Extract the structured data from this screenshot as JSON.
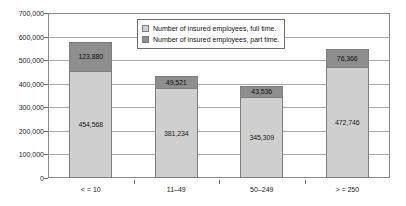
{
  "chart_data": {
    "type": "bar",
    "subtype": "stacked-bar",
    "title": "",
    "xlabel": "",
    "ylabel": "",
    "categories": [
      "< = 10",
      "11–49",
      "50–249",
      "> = 250"
    ],
    "series": [
      {
        "name": "Number of insured employees, full time.",
        "color": "#cfcfcf",
        "values": [
          454568,
          381234,
          345309,
          472746
        ],
        "labels": [
          "454,568",
          "381,234",
          "345,309",
          "472,746"
        ]
      },
      {
        "name": "Number of insured employees, part time.",
        "color": "#8e8e8e",
        "values": [
          123880,
          49521,
          43536,
          76366
        ],
        "labels": [
          "123,880",
          "49,521",
          "43,536",
          "76,366"
        ]
      }
    ],
    "totals": [
      578448,
      430755,
      388845,
      549112
    ],
    "ylim": [
      0,
      700000
    ],
    "ytick_step": 100000,
    "ytick_labels": [
      "700,000",
      "600,000",
      "500,000",
      "400,000",
      "300,000",
      "200,000",
      "100,000",
      "0"
    ],
    "ytick_values": [
      700000,
      600000,
      500000,
      400000,
      300000,
      200000,
      100000,
      0
    ],
    "grid": true,
    "grid_axis": "y",
    "legend_position": "top-center-inside"
  },
  "legend": {
    "entries": [
      {
        "label": "Number of insured employees, full time.",
        "color": "#cfcfcf"
      },
      {
        "label": "Number of insured employees, part time.",
        "color": "#8e8e8e"
      }
    ]
  }
}
